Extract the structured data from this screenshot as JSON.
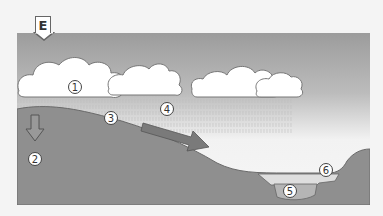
{
  "figure": {
    "label": "E",
    "markers": [
      {
        "id": "1",
        "text": "1",
        "desc": "cloud / precipitation"
      },
      {
        "id": "2",
        "text": "2",
        "desc": "infiltration into ground"
      },
      {
        "id": "3",
        "text": "3",
        "desc": "ground surface"
      },
      {
        "id": "4",
        "text": "4",
        "desc": "surface runoff"
      },
      {
        "id": "5",
        "text": "5",
        "desc": "lake bottom water"
      },
      {
        "id": "6",
        "text": "6",
        "desc": "lake surface"
      }
    ],
    "colors": {
      "sky_top": "#9a9a9a",
      "sky_bottom": "#f4f4f4",
      "ground": "#8f8f8f",
      "ground_edge": "#6c6c6c",
      "cloud": "#ffffff",
      "water_light": "#dddddd",
      "water_deep": "#b8b8b8",
      "arrow": "#7a7a7a"
    }
  }
}
